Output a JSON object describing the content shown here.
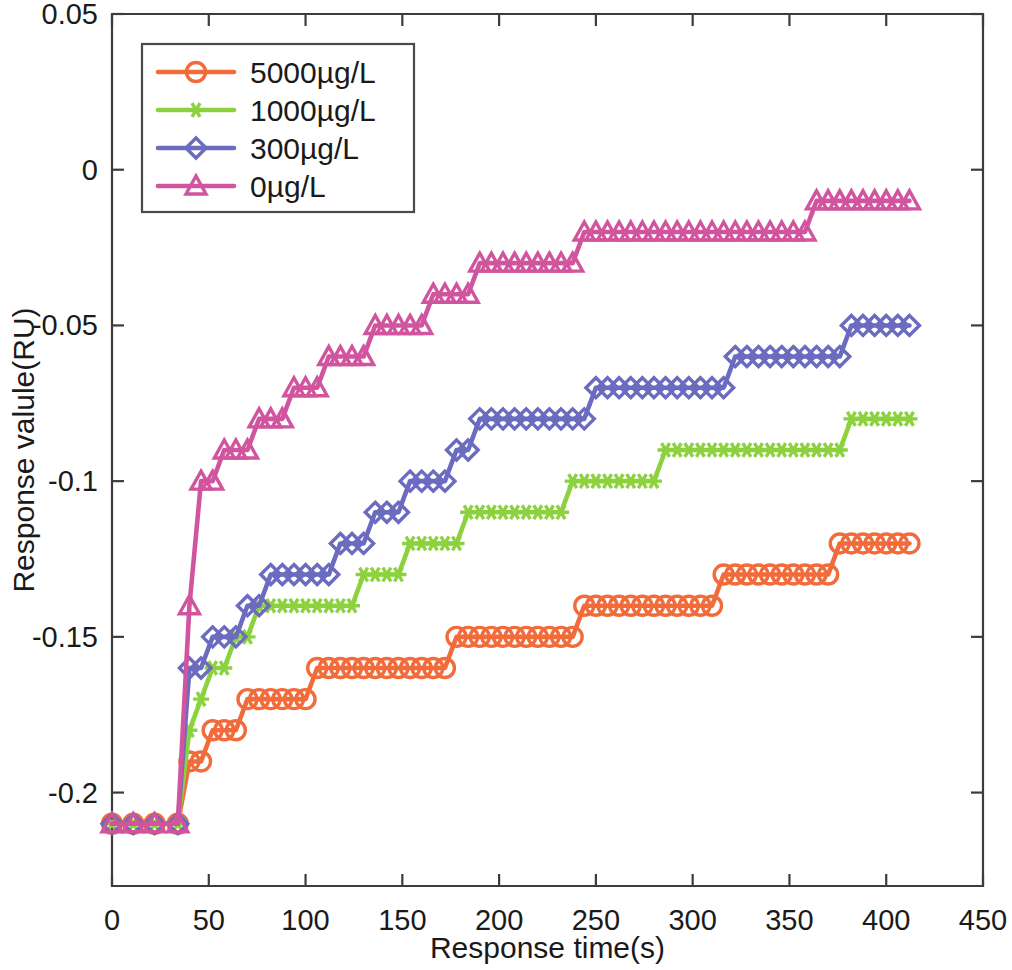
{
  "chart_data": {
    "type": "line",
    "title": "",
    "xlabel": "Response time(s)",
    "ylabel": "Response valule(RU)",
    "xlim": [
      0,
      450
    ],
    "ylim": [
      -0.23,
      0.05
    ],
    "xticks": [
      0,
      50,
      100,
      150,
      200,
      250,
      300,
      350,
      400,
      450
    ],
    "xtick_labels": [
      "0",
      "50",
      "100",
      "150",
      "200",
      "250",
      "300",
      "350",
      "400",
      "450"
    ],
    "yticks": [
      0.05,
      0,
      -0.05,
      -0.1,
      -0.15,
      -0.2
    ],
    "ytick_labels": [
      "0.05",
      "0",
      "-0.05",
      "-0.1",
      "-0.15",
      "-0.2"
    ],
    "grid": false,
    "legend_position": "upper left",
    "series": [
      {
        "name": "5000µg/L",
        "color": "#F26B3A",
        "marker": "circle",
        "x": [
          0,
          11,
          22,
          34,
          40,
          46,
          52,
          58,
          64,
          70,
          76,
          82,
          88,
          94,
          100,
          106,
          112,
          118,
          124,
          130,
          136,
          142,
          148,
          154,
          160,
          166,
          172,
          178,
          184,
          190,
          196,
          202,
          208,
          214,
          220,
          226,
          232,
          238,
          244,
          250,
          256,
          262,
          268,
          274,
          280,
          286,
          292,
          298,
          304,
          310,
          316,
          322,
          328,
          334,
          340,
          346,
          352,
          358,
          364,
          370,
          376,
          382,
          388,
          394,
          400,
          406,
          412
        ],
        "y": [
          -0.21,
          -0.21,
          -0.21,
          -0.21,
          -0.19,
          -0.19,
          -0.18,
          -0.18,
          -0.18,
          -0.17,
          -0.17,
          -0.17,
          -0.17,
          -0.17,
          -0.17,
          -0.16,
          -0.16,
          -0.16,
          -0.16,
          -0.16,
          -0.16,
          -0.16,
          -0.16,
          -0.16,
          -0.16,
          -0.16,
          -0.16,
          -0.15,
          -0.15,
          -0.15,
          -0.15,
          -0.15,
          -0.15,
          -0.15,
          -0.15,
          -0.15,
          -0.15,
          -0.15,
          -0.14,
          -0.14,
          -0.14,
          -0.14,
          -0.14,
          -0.14,
          -0.14,
          -0.14,
          -0.14,
          -0.14,
          -0.14,
          -0.14,
          -0.13,
          -0.13,
          -0.13,
          -0.13,
          -0.13,
          -0.13,
          -0.13,
          -0.13,
          -0.13,
          -0.13,
          -0.12,
          -0.12,
          -0.12,
          -0.12,
          -0.12,
          -0.12,
          -0.12
        ]
      },
      {
        "name": "1000µg/L",
        "color": "#8CD13E",
        "marker": "star",
        "x": [
          0,
          11,
          22,
          34,
          40,
          46,
          52,
          58,
          64,
          70,
          76,
          82,
          88,
          94,
          100,
          106,
          112,
          118,
          124,
          130,
          136,
          142,
          148,
          154,
          160,
          166,
          172,
          178,
          184,
          190,
          196,
          202,
          208,
          214,
          220,
          226,
          232,
          238,
          244,
          250,
          256,
          262,
          268,
          274,
          280,
          286,
          292,
          298,
          304,
          310,
          316,
          322,
          328,
          334,
          340,
          346,
          352,
          358,
          364,
          370,
          376,
          382,
          388,
          394,
          400,
          406,
          412
        ],
        "y": [
          -0.21,
          -0.21,
          -0.21,
          -0.21,
          -0.18,
          -0.17,
          -0.16,
          -0.16,
          -0.15,
          -0.15,
          -0.14,
          -0.14,
          -0.14,
          -0.14,
          -0.14,
          -0.14,
          -0.14,
          -0.14,
          -0.14,
          -0.13,
          -0.13,
          -0.13,
          -0.13,
          -0.12,
          -0.12,
          -0.12,
          -0.12,
          -0.12,
          -0.11,
          -0.11,
          -0.11,
          -0.11,
          -0.11,
          -0.11,
          -0.11,
          -0.11,
          -0.11,
          -0.1,
          -0.1,
          -0.1,
          -0.1,
          -0.1,
          -0.1,
          -0.1,
          -0.1,
          -0.09,
          -0.09,
          -0.09,
          -0.09,
          -0.09,
          -0.09,
          -0.09,
          -0.09,
          -0.09,
          -0.09,
          -0.09,
          -0.09,
          -0.09,
          -0.09,
          -0.09,
          -0.09,
          -0.08,
          -0.08,
          -0.08,
          -0.08,
          -0.08,
          -0.08
        ]
      },
      {
        "name": "300µg/L",
        "color": "#6B6BBF",
        "marker": "diamond",
        "x": [
          0,
          11,
          22,
          34,
          40,
          46,
          52,
          58,
          64,
          70,
          76,
          82,
          88,
          94,
          100,
          106,
          112,
          118,
          124,
          130,
          136,
          142,
          148,
          154,
          160,
          166,
          172,
          178,
          184,
          190,
          196,
          202,
          208,
          214,
          220,
          226,
          232,
          238,
          244,
          250,
          256,
          262,
          268,
          274,
          280,
          286,
          292,
          298,
          304,
          310,
          316,
          322,
          328,
          334,
          340,
          346,
          352,
          358,
          364,
          370,
          376,
          382,
          388,
          394,
          400,
          406,
          412
        ],
        "y": [
          -0.21,
          -0.21,
          -0.21,
          -0.21,
          -0.16,
          -0.16,
          -0.15,
          -0.15,
          -0.15,
          -0.14,
          -0.14,
          -0.13,
          -0.13,
          -0.13,
          -0.13,
          -0.13,
          -0.13,
          -0.12,
          -0.12,
          -0.12,
          -0.11,
          -0.11,
          -0.11,
          -0.1,
          -0.1,
          -0.1,
          -0.1,
          -0.09,
          -0.09,
          -0.08,
          -0.08,
          -0.08,
          -0.08,
          -0.08,
          -0.08,
          -0.08,
          -0.08,
          -0.08,
          -0.08,
          -0.07,
          -0.07,
          -0.07,
          -0.07,
          -0.07,
          -0.07,
          -0.07,
          -0.07,
          -0.07,
          -0.07,
          -0.07,
          -0.07,
          -0.06,
          -0.06,
          -0.06,
          -0.06,
          -0.06,
          -0.06,
          -0.06,
          -0.06,
          -0.06,
          -0.06,
          -0.05,
          -0.05,
          -0.05,
          -0.05,
          -0.05,
          -0.05
        ]
      },
      {
        "name": "0µg/L",
        "color": "#D1559E",
        "marker": "triangle",
        "x": [
          0,
          11,
          22,
          34,
          40,
          46,
          52,
          58,
          64,
          70,
          76,
          82,
          88,
          94,
          100,
          106,
          112,
          118,
          124,
          130,
          136,
          142,
          148,
          154,
          160,
          166,
          172,
          178,
          184,
          190,
          196,
          202,
          208,
          214,
          220,
          226,
          232,
          238,
          244,
          250,
          256,
          262,
          268,
          274,
          280,
          286,
          292,
          298,
          304,
          310,
          316,
          322,
          328,
          334,
          340,
          346,
          352,
          358,
          364,
          370,
          376,
          382,
          388,
          394,
          400,
          406,
          412
        ],
        "y": [
          -0.21,
          -0.21,
          -0.21,
          -0.21,
          -0.14,
          -0.1,
          -0.1,
          -0.09,
          -0.09,
          -0.09,
          -0.08,
          -0.08,
          -0.08,
          -0.07,
          -0.07,
          -0.07,
          -0.06,
          -0.06,
          -0.06,
          -0.06,
          -0.05,
          -0.05,
          -0.05,
          -0.05,
          -0.05,
          -0.04,
          -0.04,
          -0.04,
          -0.04,
          -0.03,
          -0.03,
          -0.03,
          -0.03,
          -0.03,
          -0.03,
          -0.03,
          -0.03,
          -0.03,
          -0.02,
          -0.02,
          -0.02,
          -0.02,
          -0.02,
          -0.02,
          -0.02,
          -0.02,
          -0.02,
          -0.02,
          -0.02,
          -0.02,
          -0.02,
          -0.02,
          -0.02,
          -0.02,
          -0.02,
          -0.02,
          -0.02,
          -0.02,
          -0.01,
          -0.01,
          -0.01,
          -0.01,
          -0.01,
          -0.01,
          -0.01,
          -0.01,
          -0.01
        ]
      }
    ]
  },
  "legend": {
    "entries": [
      {
        "label": "5000µg/L"
      },
      {
        "label": "1000µg/L"
      },
      {
        "label": "300µg/L"
      },
      {
        "label": "0µg/L"
      }
    ]
  }
}
